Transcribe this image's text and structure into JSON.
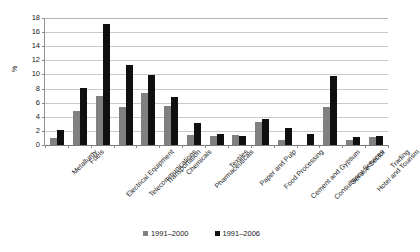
{
  "chart_data": {
    "type": "bar",
    "title": "",
    "xlabel": "",
    "ylabel": "%",
    "ylim": [
      0,
      18
    ],
    "ytick_step": 2,
    "yticks": [
      0,
      2,
      4,
      6,
      8,
      10,
      12,
      14,
      16,
      18
    ],
    "grid": true,
    "legend_position": "bottom",
    "categories": [
      "Metallurgy",
      "Fuels",
      "Electrical Equipment",
      "Telecommunications",
      "Transportation",
      "Chemicals",
      "Pharmaceuticals",
      "Textiles",
      "Paper and Pulp",
      "Food Processing",
      "Cement and Gypsum",
      "Consultancy Services",
      "Service Sector",
      "Hotel and Tourism",
      "Trading"
    ],
    "series": [
      {
        "name": "1991–2000",
        "color": "#808080",
        "values": [
          1.0,
          4.8,
          6.9,
          5.4,
          7.3,
          5.5,
          1.35,
          1.2,
          1.4,
          3.2,
          0.7,
          0,
          5.3,
          0.7,
          1.15
        ]
      },
      {
        "name": "1991–2006",
        "color": "#101010",
        "values": [
          2.05,
          8.0,
          17.0,
          11.2,
          9.8,
          6.7,
          3.1,
          1.5,
          1.2,
          3.6,
          2.4,
          1.5,
          9.7,
          1.1,
          1.3
        ]
      }
    ]
  }
}
